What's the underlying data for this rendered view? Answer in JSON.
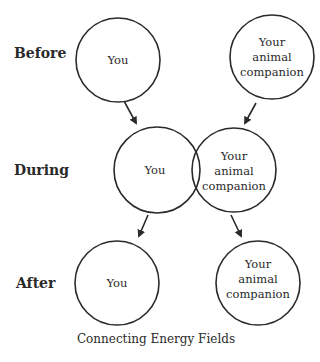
{
  "diagram": {
    "caption": "Connecting Energy Fields",
    "stages": [
      {
        "label": "Before",
        "you": "You",
        "companion": [
          "Your",
          "animal",
          "companion"
        ]
      },
      {
        "label": "During",
        "you": "You",
        "companion": [
          "Your",
          "animal",
          "companion"
        ]
      },
      {
        "label": "After",
        "you": "You",
        "companion": [
          "Your",
          "animal",
          "companion"
        ]
      }
    ],
    "colors": {
      "stroke": "#2a2a2a",
      "background": "#ffffff"
    }
  }
}
